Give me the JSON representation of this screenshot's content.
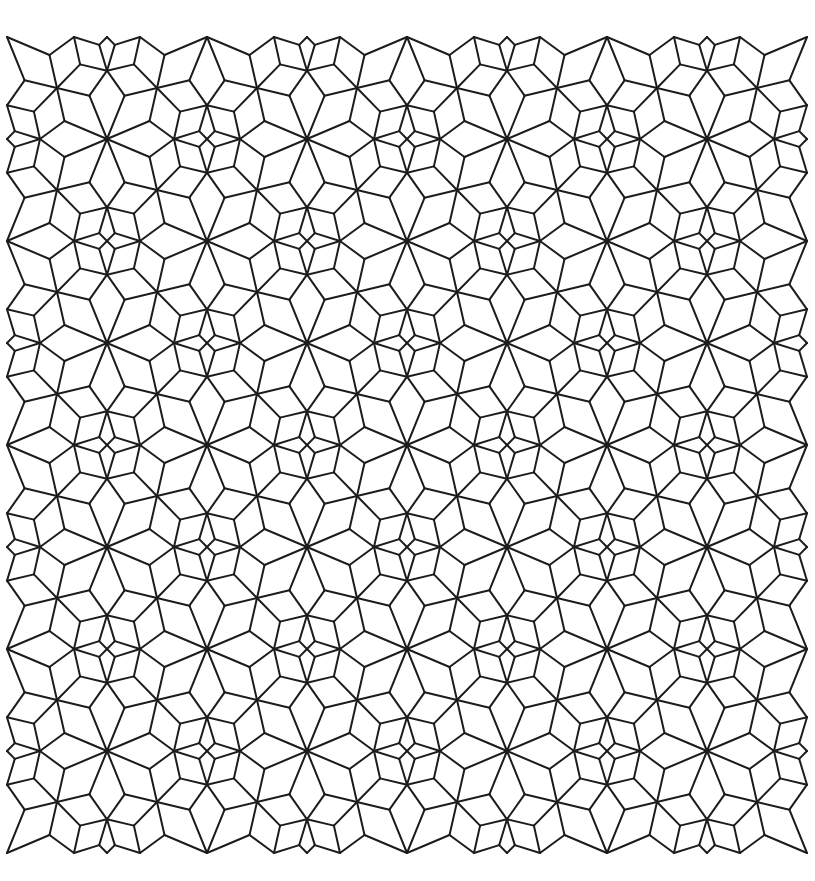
{
  "canvas": {
    "width": 815,
    "height": 881,
    "background": "#ffffff"
  },
  "style": {
    "stroke": "#1c1c1c",
    "stroke_width": 2
  },
  "lattice": {
    "origin": [
      7,
      37
    ],
    "spacing": [
      100,
      102
    ],
    "cols": 9,
    "rows": 9,
    "rule": "big 8-pointed star where (i+j) even, small 4-pointed star where (i+j) odd; hub vertex at center of every cell"
  },
  "big_star": {
    "name": "eight-pointed-star",
    "mid_radius": 46,
    "axis_radius": 67
  },
  "small_star": {
    "name": "four-pointed-star",
    "inner_radius": 11,
    "axis_radius": 34,
    "outer_diag_radius": 38
  }
}
